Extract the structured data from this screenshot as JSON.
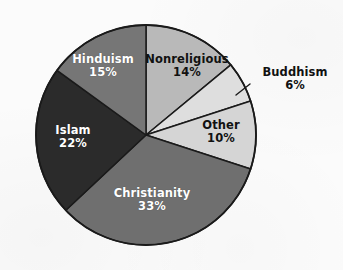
{
  "figure": {
    "background_color": "#fbfbfb",
    "width": 343,
    "height": 270
  },
  "chart_data": {
    "type": "pie",
    "title": "",
    "subtitle": "",
    "xlabel": "",
    "ylabel": "",
    "grid": false,
    "legend_position": "none",
    "labels_inside": true,
    "value_unit": "%",
    "start_angle_deg": 0,
    "direction": "clockwise",
    "center": {
      "x": 146,
      "y": 135
    },
    "radius": 110,
    "categories": [
      "Nonreligious",
      "Buddhism",
      "Other",
      "Christianity",
      "Islam",
      "Hinduism"
    ],
    "values": [
      14,
      6,
      10,
      33,
      22,
      15
    ],
    "total": 100,
    "slices": [
      {
        "name": "Nonreligious",
        "value": 14,
        "value_label": "14%",
        "color": "#b9b9b9",
        "text_color": "#111111",
        "label_placement": "inside"
      },
      {
        "name": "Buddhism",
        "value": 6,
        "value_label": "6%",
        "color": "#dedede",
        "text_color": "#111111",
        "label_placement": "outside",
        "leader_line": true
      },
      {
        "name": "Other",
        "value": 10,
        "value_label": "10%",
        "color": "#d5d5d5",
        "text_color": "#111111",
        "label_placement": "inside"
      },
      {
        "name": "Christianity",
        "value": 33,
        "value_label": "33%",
        "color": "#6f6f6f",
        "text_color": "#ffffff",
        "label_placement": "inside"
      },
      {
        "name": "Islam",
        "value": 22,
        "value_label": "22%",
        "color": "#2b2b2b",
        "text_color": "#ffffff",
        "label_placement": "inside"
      },
      {
        "name": "Hinduism",
        "value": 15,
        "value_label": "15%",
        "color": "#767676",
        "text_color": "#ffffff",
        "label_placement": "inside"
      }
    ],
    "outline_color": "#1a1a1a"
  }
}
